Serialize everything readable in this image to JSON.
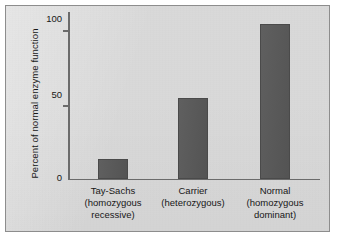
{
  "figure": {
    "background_color": "#d9d9d9",
    "frame_color": "#8d8d8d",
    "axis_color": "#6b6b6b",
    "bar_color": "#585858",
    "text_color": "#171717"
  },
  "chart_data": {
    "type": "bar",
    "title": "",
    "xlabel": "",
    "ylabel": "Percent of normal enzyme function",
    "categories": [
      "Tay-Sachs\n(homozygous\nrecessive)",
      "Carrier\n(heterozygous)",
      "Normal\n(homozygous\ndominant)"
    ],
    "category_lines": [
      [
        "Tay-Sachs",
        "(homozygous",
        "recessive)"
      ],
      [
        "Carrier",
        "(heterozygous)"
      ],
      [
        "Normal",
        "(homozygous",
        "dominant)"
      ]
    ],
    "values": [
      13,
      54,
      103
    ],
    "ylim": [
      0,
      112
    ],
    "yticks": [
      0,
      50,
      100
    ],
    "ytick_labels": [
      "0",
      "50",
      "100"
    ],
    "grid": false,
    "legend": null,
    "series": [
      {
        "name": "Percent of normal enzyme function",
        "values": [
          13,
          54,
          103
        ]
      }
    ]
  },
  "axis": {
    "ytick_0": "0",
    "ytick_50": "50",
    "ytick_100": "100",
    "ylabel": "Percent of normal enzyme function"
  },
  "categories": {
    "c0_line0": "Tay-Sachs",
    "c0_line1": "(homozygous",
    "c0_line2": "recessive)",
    "c1_line0": "Carrier",
    "c1_line1": "(heterozygous)",
    "c2_line0": "Normal",
    "c2_line1": "(homozygous",
    "c2_line2": "dominant)"
  }
}
